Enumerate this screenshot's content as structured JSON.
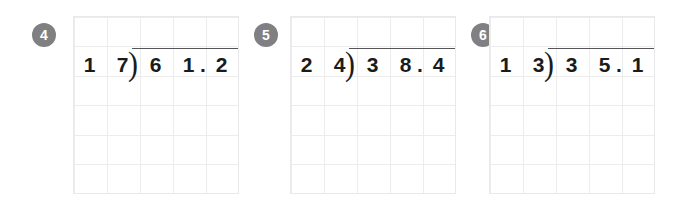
{
  "worksheet": {
    "type": "long-division-practice",
    "grid": {
      "columns": 5,
      "rows": 6,
      "cell_width": 33,
      "cell_height": 29.5,
      "line_color": "#ececed",
      "border_color": "#e9e9ec"
    },
    "badge_color": "#808083",
    "badge_text_color": "#ffffff",
    "ink_color": "#1b1b1b",
    "overbar_color": "#55555a"
  },
  "problems": [
    {
      "number": "4",
      "divisor": "17",
      "divisor_digits": [
        "1",
        "7"
      ],
      "dividend": "61.2",
      "dividend_digits": [
        "6",
        "1",
        ".",
        "2"
      ],
      "bracket": ")",
      "expression": "17 ) 61.2"
    },
    {
      "number": "5",
      "divisor": "24",
      "divisor_digits": [
        "2",
        "4"
      ],
      "dividend": "38.4",
      "dividend_digits": [
        "3",
        "8",
        ".",
        "4"
      ],
      "bracket": ")",
      "expression": "24 ) 38.4"
    },
    {
      "number": "6",
      "divisor": "13",
      "divisor_digits": [
        "1",
        "3"
      ],
      "dividend": "35.1",
      "dividend_digits": [
        "3",
        "5",
        ".",
        "1"
      ],
      "bracket": ")",
      "expression": "13 ) 35.1"
    }
  ]
}
